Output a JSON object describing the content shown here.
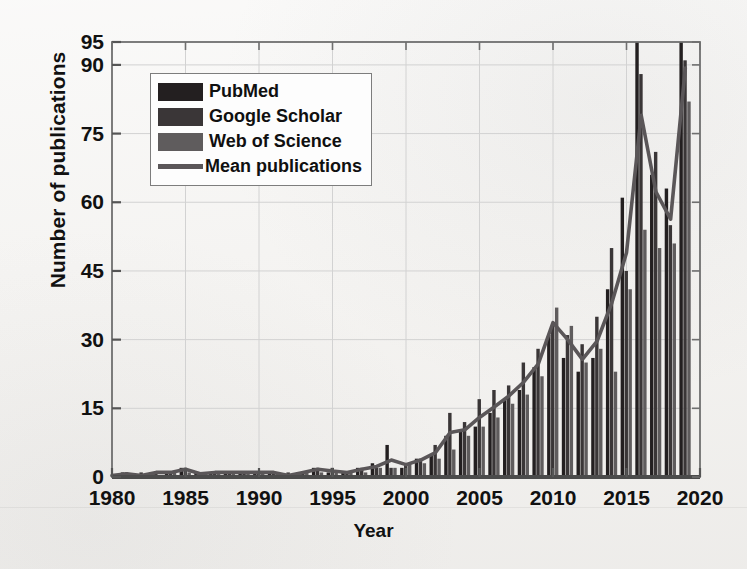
{
  "chart_data": {
    "type": "bar",
    "title": "",
    "xlabel": "Year",
    "ylabel": "Number of publications",
    "xlim": [
      1980,
      2020
    ],
    "ylim": [
      0,
      95
    ],
    "xticks": [
      1980,
      1985,
      1990,
      1995,
      2000,
      2005,
      2010,
      2015,
      2020
    ],
    "yticks": [
      0,
      15,
      30,
      45,
      60,
      75,
      90,
      95
    ],
    "grid": true,
    "legend_position": "upper-left-inside",
    "categories": [
      1980,
      1981,
      1982,
      1983,
      1984,
      1985,
      1986,
      1987,
      1988,
      1989,
      1990,
      1991,
      1992,
      1993,
      1994,
      1995,
      1996,
      1997,
      1998,
      1999,
      2000,
      2001,
      2002,
      2003,
      2004,
      2005,
      2006,
      2007,
      2008,
      2009,
      2010,
      2011,
      2012,
      2013,
      2014,
      2015,
      2016,
      2017,
      2018,
      2019
    ],
    "series": [
      {
        "name": "PubMed",
        "color": "#231f20",
        "values": [
          0,
          1,
          0,
          1,
          1,
          2,
          1,
          1,
          1,
          1,
          1,
          1,
          0,
          1,
          2,
          1,
          1,
          2,
          3,
          7,
          2,
          4,
          5,
          9,
          10,
          11,
          14,
          17,
          19,
          24,
          31,
          26,
          23,
          26,
          41,
          61,
          95,
          66,
          63,
          95
        ]
      },
      {
        "name": "Google Scholar",
        "color": "#3a3637",
        "values": [
          0,
          1,
          1,
          1,
          1,
          2,
          1,
          1,
          1,
          1,
          1,
          1,
          1,
          1,
          2,
          2,
          1,
          2,
          2,
          2,
          3,
          4,
          7,
          14,
          12,
          17,
          19,
          20,
          25,
          28,
          33,
          31,
          29,
          35,
          50,
          45,
          88,
          71,
          55,
          91
        ]
      },
      {
        "name": "Web of Science",
        "color": "#5f5c5d",
        "values": [
          0,
          0,
          0,
          0,
          1,
          1,
          0,
          1,
          1,
          1,
          1,
          1,
          0,
          1,
          1,
          1,
          1,
          1,
          2,
          2,
          3,
          3,
          4,
          6,
          9,
          11,
          13,
          16,
          18,
          22,
          37,
          33,
          25,
          28,
          23,
          41,
          54,
          50,
          51,
          82
        ]
      }
    ],
    "line_series": {
      "name": "Mean publications",
      "color": "#5a5658",
      "values": [
        0.3,
        0.7,
        0.3,
        1.0,
        1.0,
        1.7,
        0.7,
        1.0,
        1.0,
        1.0,
        1.0,
        1.0,
        0.3,
        1.0,
        1.7,
        1.3,
        1.0,
        1.7,
        2.3,
        3.7,
        2.7,
        3.7,
        5.3,
        9.7,
        10.3,
        13.0,
        15.3,
        17.7,
        20.7,
        24.7,
        33.7,
        30.0,
        25.7,
        29.7,
        38.0,
        49.0,
        79.0,
        62.3,
        56.3,
        89.3
      ]
    }
  },
  "legend": {
    "items": [
      {
        "label": "PubMed",
        "color": "#231f20",
        "marker": "swatch"
      },
      {
        "label": "Google Scholar",
        "color": "#3a3637",
        "marker": "swatch"
      },
      {
        "label": "Web of Science",
        "color": "#5f5c5d",
        "marker": "swatch"
      },
      {
        "label": "Mean publications",
        "color": "#5a5658",
        "marker": "line"
      }
    ]
  },
  "axis": {
    "frame_color": "#6f6f6f",
    "grid_color": "#d2d2d2",
    "text_color": "#111111"
  }
}
